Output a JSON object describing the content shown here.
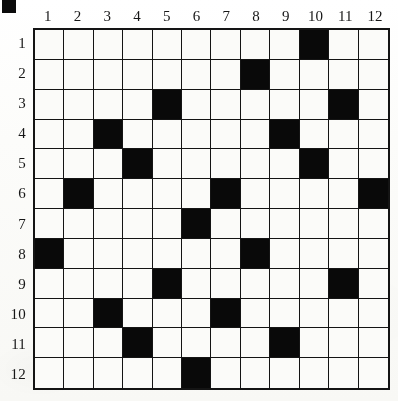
{
  "puzzle": {
    "title": "12x12 black-and-white cell grid",
    "grid_size": {
      "rows": 12,
      "cols": 12
    },
    "column_headers": [
      "1",
      "2",
      "3",
      "4",
      "5",
      "6",
      "7",
      "8",
      "9",
      "10",
      "11",
      "12"
    ],
    "row_headers": [
      "1",
      "2",
      "3",
      "4",
      "5",
      "6",
      "7",
      "8",
      "9",
      "10",
      "11",
      "12"
    ],
    "colors": {
      "filled_cell": "#090909",
      "empty_cell": "#fbfbf9",
      "grid_line": "#141414",
      "paper": "#fdfdfb",
      "label_text": "#161616"
    },
    "corner_mark": {
      "present": true,
      "shape": "filled-square",
      "color": "#0b0b0b"
    },
    "filled_cells_by_row": {
      "1": [
        10
      ],
      "2": [
        8
      ],
      "3": [
        5,
        11
      ],
      "4": [
        3,
        9
      ],
      "5": [
        4,
        10
      ],
      "6": [
        2,
        7,
        12
      ],
      "7": [
        6
      ],
      "8": [
        1,
        8
      ],
      "9": [
        5,
        11
      ],
      "10": [
        3,
        7
      ],
      "11": [
        4,
        9
      ],
      "12": [
        6
      ]
    },
    "matrix": [
      [
        0,
        0,
        0,
        0,
        0,
        0,
        0,
        0,
        0,
        1,
        0,
        0
      ],
      [
        0,
        0,
        0,
        0,
        0,
        0,
        0,
        1,
        0,
        0,
        0,
        0
      ],
      [
        0,
        0,
        0,
        0,
        1,
        0,
        0,
        0,
        0,
        0,
        1,
        0
      ],
      [
        0,
        0,
        1,
        0,
        0,
        0,
        0,
        0,
        1,
        0,
        0,
        0
      ],
      [
        0,
        0,
        0,
        1,
        0,
        0,
        0,
        0,
        0,
        1,
        0,
        0
      ],
      [
        0,
        1,
        0,
        0,
        0,
        0,
        1,
        0,
        0,
        0,
        0,
        1
      ],
      [
        0,
        0,
        0,
        0,
        0,
        1,
        0,
        0,
        0,
        0,
        0,
        0
      ],
      [
        1,
        0,
        0,
        0,
        0,
        0,
        0,
        1,
        0,
        0,
        0,
        0
      ],
      [
        0,
        0,
        0,
        0,
        1,
        0,
        0,
        0,
        0,
        0,
        1,
        0
      ],
      [
        0,
        0,
        1,
        0,
        0,
        0,
        1,
        0,
        0,
        0,
        0,
        0
      ],
      [
        0,
        0,
        0,
        1,
        0,
        0,
        0,
        0,
        1,
        0,
        0,
        0
      ],
      [
        0,
        0,
        0,
        0,
        0,
        1,
        0,
        0,
        0,
        0,
        0,
        0
      ]
    ],
    "filled_count": 21
  }
}
